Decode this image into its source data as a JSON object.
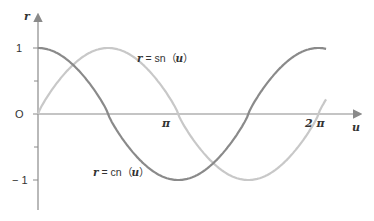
{
  "chart_data": {
    "type": "line",
    "title": "",
    "xlabel": "u",
    "ylabel": "r",
    "x_ticks": [
      {
        "label": "π",
        "value": 3.14159
      },
      {
        "label": "2π",
        "value": 6.28318
      }
    ],
    "y_ticks": [
      {
        "label": "1",
        "value": 1
      },
      {
        "label": "0",
        "value": 0
      },
      {
        "label": "-1",
        "value": -1
      }
    ],
    "y_minor_ticks": [
      0.5,
      -0.5
    ],
    "xlim": [
      0,
      6.9
    ],
    "ylim": [
      -1.35,
      1.35
    ],
    "grid": false,
    "legend": "inline annotations",
    "series": [
      {
        "name": "r = cn (u)",
        "color": "#8a8a8a",
        "function": "cn",
        "period": 6.6,
        "x_start": 0,
        "x_end": 6.8
      },
      {
        "name": "r = sn (u)",
        "color": "#c8c8c8",
        "function": "sn",
        "period": 6.6,
        "x_start": 0,
        "x_end": 6.8
      }
    ]
  },
  "labels": {
    "y_axis": "r",
    "x_axis": "u",
    "y_one": "1",
    "y_zero": "O",
    "y_minus_one": "− 1",
    "x_pi": "π",
    "x_two_pi": "2 π",
    "sn_label_prefix": "r",
    "sn_label_mid": " = sn（",
    "sn_label_var": "u",
    "sn_label_suffix": "）",
    "cn_label_prefix": "r",
    "cn_label_mid": " = cn（",
    "cn_label_var": "u",
    "cn_label_suffix": "）"
  }
}
